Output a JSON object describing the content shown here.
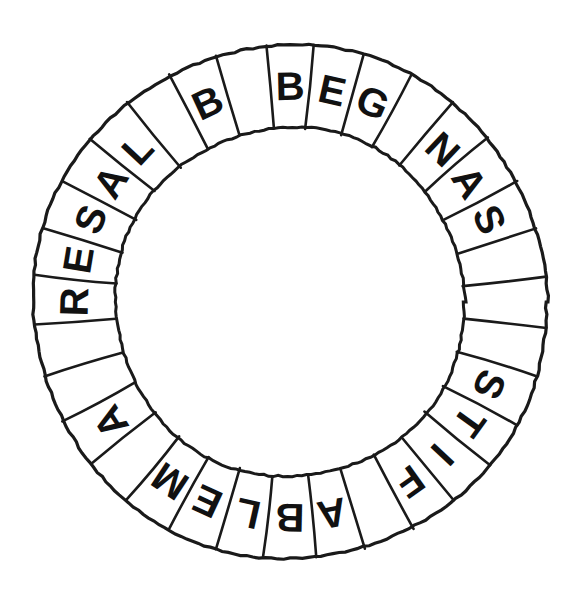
{
  "figure": {
    "kind": "letter-ring-diagram",
    "background_color": "#ffffff",
    "ink_color": "#1a1a1a",
    "letter_color": "#111111"
  },
  "geometry": {
    "center_x": 290,
    "center_y": 302,
    "outer_radius": 257,
    "inner_radius": 175,
    "cell_count": 32,
    "start_angle_deg": -95.6,
    "outer_stroke_width": 3.2,
    "inner_stroke_width": 3.0,
    "divider_stroke_width": 2.6,
    "letter_font_size": 40
  },
  "ring": {
    "cells": [
      {
        "index": 0,
        "letter": "B"
      },
      {
        "index": 1,
        "letter": "E"
      },
      {
        "index": 2,
        "letter": "G"
      },
      {
        "index": 3,
        "letter": ""
      },
      {
        "index": 4,
        "letter": "N"
      },
      {
        "index": 5,
        "letter": "A"
      },
      {
        "index": 6,
        "letter": "S"
      },
      {
        "index": 7,
        "letter": ""
      },
      {
        "index": 8,
        "letter": ""
      },
      {
        "index": 9,
        "letter": ""
      },
      {
        "index": 10,
        "letter": "S"
      },
      {
        "index": 11,
        "letter": "T"
      },
      {
        "index": 12,
        "letter": "I"
      },
      {
        "index": 13,
        "letter": "F"
      },
      {
        "index": 14,
        "letter": ""
      },
      {
        "index": 15,
        "letter": "A"
      },
      {
        "index": 16,
        "letter": "B"
      },
      {
        "index": 17,
        "letter": "L"
      },
      {
        "index": 18,
        "letter": "E"
      },
      {
        "index": 19,
        "letter": "M"
      },
      {
        "index": 20,
        "letter": ""
      },
      {
        "index": 21,
        "letter": "A"
      },
      {
        "index": 22,
        "letter": ""
      },
      {
        "index": 23,
        "letter": ""
      },
      {
        "index": 24,
        "letter": "R"
      },
      {
        "index": 25,
        "letter": "E"
      },
      {
        "index": 26,
        "letter": "S"
      },
      {
        "index": 27,
        "letter": "A"
      },
      {
        "index": 28,
        "letter": "L"
      },
      {
        "index": 29,
        "letter": ""
      },
      {
        "index": 30,
        "letter": "B"
      },
      {
        "index": 31,
        "letter": ""
      },
      {
        "index": 32,
        "letter": "D"
      },
      {
        "index": 33,
        "letter": "P"
      },
      {
        "index": 34,
        "letter": ""
      },
      {
        "index": 35,
        "letter": "E"
      },
      {
        "index": 36,
        "letter": ""
      },
      {
        "index": 37,
        "letter": "E"
      },
      {
        "index": 38,
        "letter": "D"
      },
      {
        "index": 39,
        "letter": "E"
      },
      {
        "index": 40,
        "letter": "N"
      },
      {
        "index": 41,
        "letter": "T"
      },
      {
        "index": 42,
        "letter": ""
      },
      {
        "index": 43,
        "letter": ""
      }
    ],
    "letter_sequence_clockwise": "BEG NAS   STIF ABLEM A  RESAL B DP E EDENT  ",
    "words_visible": [
      "BEG",
      "NAS",
      "STIF",
      "ABLEM",
      "A",
      "RESAL",
      "B",
      "DP",
      "E",
      "EDENT"
    ]
  }
}
